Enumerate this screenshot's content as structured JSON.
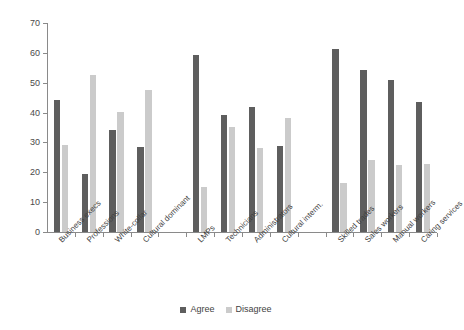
{
  "chart_data": {
    "type": "bar",
    "title": "",
    "subtitle": "",
    "xlabel": "",
    "ylabel": "",
    "ylim": [
      0,
      70
    ],
    "yticks": [
      0,
      10,
      20,
      30,
      40,
      50,
      60,
      70
    ],
    "grid": false,
    "legend_position": "bottom-center",
    "categories": [
      "Business execs",
      "Professions",
      "White-collar",
      "Cultural dominant",
      "LMPs",
      "Technicians",
      "Administrators",
      "Cultural interm.",
      "Skilled trades",
      "Sales workers",
      "Manual workers",
      "Caring services"
    ],
    "group_breaks_after": [
      3,
      7
    ],
    "series": [
      {
        "name": "Agree",
        "color": "#5e5e5e",
        "values": [
          44.2,
          19.3,
          34.1,
          28.6,
          59.2,
          39.2,
          42.0,
          28.7,
          61.3,
          54.3,
          51.0,
          43.5
        ]
      },
      {
        "name": "Disagree",
        "color": "#cbcbcb",
        "values": [
          29.0,
          52.5,
          40.3,
          47.6,
          15.0,
          35.2,
          28.0,
          38.2,
          16.5,
          24.0,
          22.5,
          22.8
        ]
      }
    ]
  },
  "legend": {
    "items": [
      {
        "label": "Agree",
        "swatch": "agree-swatch"
      },
      {
        "label": "Disagree",
        "swatch": "disagree-swatch"
      }
    ]
  }
}
